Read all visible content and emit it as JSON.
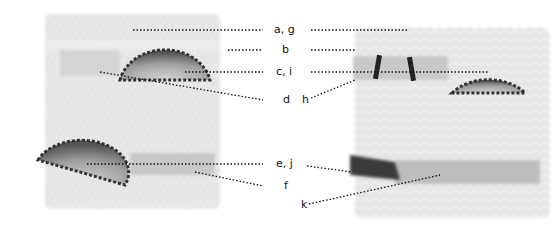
{
  "figure": {
    "labels": {
      "a_g": "a, g",
      "b": "b",
      "c_i": "c, i",
      "d": "d",
      "h": "h",
      "e_j": "e, j",
      "f": "f",
      "k": "k"
    },
    "panels": [
      {
        "name": "left-specimen",
        "description": "grayscale tissue section with two semicircular scalloped structures"
      },
      {
        "name": "right-specimen",
        "description": "grayscale tissue section with semicircular structure and dark marked bands"
      }
    ],
    "colors": {
      "leader_line": "#111111",
      "tissue_light": "#d9d9d9",
      "structure_dark": "#555555"
    }
  }
}
